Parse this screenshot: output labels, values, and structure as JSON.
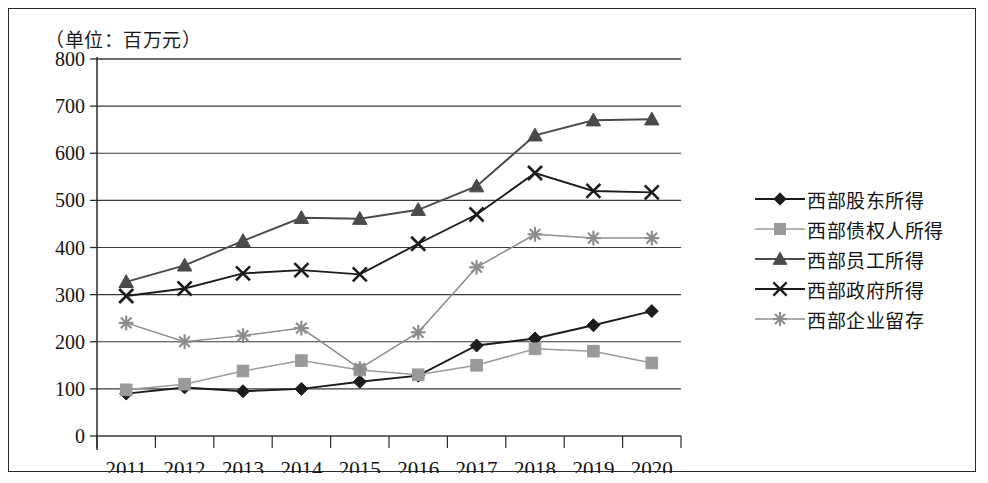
{
  "figure": {
    "unit_label": "（单位：百万元）"
  },
  "chart_data": {
    "type": "line",
    "title": "（单位：百万元）",
    "xlabel": "",
    "ylabel": "",
    "ylim": [
      0,
      800
    ],
    "ytick_step": 100,
    "yticks": [
      "800",
      "700",
      "600",
      "500",
      "400",
      "300",
      "200",
      "100",
      "0"
    ],
    "grid": true,
    "legend_position": "right",
    "categories": [
      "2011",
      "2012",
      "2013",
      "2014",
      "2015",
      "2016",
      "2017",
      "2018",
      "2019",
      "2020"
    ],
    "series": [
      {
        "name": "西部股东所得",
        "marker": "diamond",
        "color": "#1c1c1c",
        "values": [
          90,
          103,
          95,
          100,
          115,
          128,
          192,
          207,
          235,
          265
        ]
      },
      {
        "name": "西部债权人所得",
        "marker": "square",
        "color": "#9a9a9a",
        "values": [
          98,
          110,
          138,
          160,
          140,
          130,
          150,
          185,
          180,
          155
        ]
      },
      {
        "name": "西部员工所得",
        "marker": "triangle",
        "color": "#4a4a4a",
        "values": [
          327,
          362,
          414,
          463,
          461,
          480,
          530,
          638,
          670,
          672
        ]
      },
      {
        "name": "西部政府所得",
        "marker": "x",
        "color": "#1c1c1c",
        "values": [
          297,
          313,
          345,
          352,
          343,
          408,
          470,
          558,
          520,
          517
        ]
      },
      {
        "name": "西部企业留存",
        "marker": "asterisk",
        "color": "#8c8c8c",
        "values": [
          240,
          200,
          213,
          229,
          143,
          220,
          358,
          428,
          420,
          420
        ]
      }
    ]
  }
}
